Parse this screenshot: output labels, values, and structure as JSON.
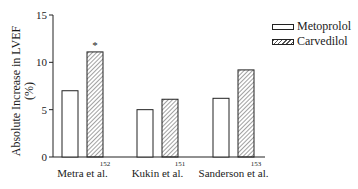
{
  "chart_data": {
    "type": "bar",
    "title": "",
    "xlabel": "",
    "ylabel": "Absolute Increase in LVEF (%)",
    "ylabel_lines": [
      "Absolute Increase in LVEF",
      "(%)"
    ],
    "ylim": [
      0,
      15
    ],
    "yticks": [
      0,
      5,
      10,
      15
    ],
    "grid": false,
    "legend_position": "top-right",
    "categories": [
      "Metra et al.",
      "Kukin et al.",
      "Sanderson et al."
    ],
    "references": [
      "152",
      "151",
      "153"
    ],
    "series": [
      {
        "name": "Metoprolol",
        "pattern": "open",
        "values": [
          7,
          5,
          6.2
        ]
      },
      {
        "name": "Carvedilol",
        "pattern": "hatched",
        "values": [
          11.1,
          6.1,
          9.2
        ]
      }
    ],
    "annotations": [
      {
        "text": "*",
        "category": "Metra et al.",
        "series": "Carvedilol",
        "meaning": "significant difference"
      }
    ]
  },
  "legend": {
    "items": [
      {
        "label": "Metoprolol"
      },
      {
        "label": "Carvedilol"
      }
    ]
  }
}
